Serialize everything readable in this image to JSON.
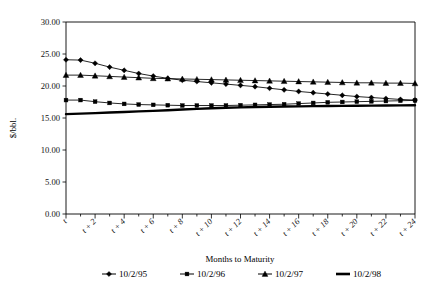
{
  "chart_data": {
    "type": "line",
    "title": "",
    "xlabel": "Months to Maturity",
    "ylabel": "$/bbl.",
    "ylim": [
      0.0,
      30.0
    ],
    "ytick_labels": [
      "0.00",
      "5.00",
      "10.00",
      "15.00",
      "20.00",
      "25.00",
      "30.00"
    ],
    "ytick_values": [
      0.0,
      5.0,
      10.0,
      15.0,
      20.0,
      25.0,
      30.0
    ],
    "grid": false,
    "legend_position": "bottom",
    "x": [
      "t",
      "t + 1",
      "t + 2",
      "t + 3",
      "t + 4",
      "t + 5",
      "t + 6",
      "t + 7",
      "t + 8",
      "t + 9",
      "t + 10",
      "t + 11",
      "t + 12",
      "t + 13",
      "t + 14",
      "t + 15",
      "t + 16",
      "t + 17",
      "t + 18",
      "t + 19",
      "t + 20",
      "t + 21",
      "t + 22",
      "t + 23",
      "t + 24"
    ],
    "xtick_labels": [
      "t",
      "t + 2",
      "t + 4",
      "t + 6",
      "t + 8",
      "t + 10",
      "t + 12",
      "t + 14",
      "t + 16",
      "t + 18",
      "t + 20",
      "t + 22",
      "t + 24"
    ],
    "xtick_indices": [
      0,
      2,
      4,
      6,
      8,
      10,
      12,
      14,
      16,
      18,
      20,
      22,
      24
    ],
    "series": [
      {
        "name": "10/2/95",
        "marker": "diamond",
        "line_weight": "thin",
        "values": [
          24.1,
          24.05,
          23.55,
          22.95,
          22.45,
          21.95,
          21.55,
          21.2,
          20.9,
          20.7,
          20.5,
          20.3,
          20.1,
          19.9,
          19.65,
          19.4,
          19.15,
          18.95,
          18.75,
          18.55,
          18.35,
          18.2,
          18.05,
          17.9,
          17.8
        ]
      },
      {
        "name": "10/2/96",
        "marker": "square",
        "line_weight": "thin",
        "values": [
          17.8,
          17.8,
          17.55,
          17.35,
          17.2,
          17.1,
          17.05,
          17.0,
          16.95,
          16.95,
          16.95,
          16.95,
          17.0,
          17.05,
          17.1,
          17.15,
          17.25,
          17.35,
          17.45,
          17.5,
          17.55,
          17.6,
          17.65,
          17.7,
          17.75
        ]
      },
      {
        "name": "10/2/97",
        "marker": "triangle",
        "line_weight": "thin",
        "values": [
          21.7,
          21.7,
          21.6,
          21.5,
          21.4,
          21.3,
          21.2,
          21.15,
          21.1,
          21.05,
          21.0,
          20.95,
          20.9,
          20.85,
          20.8,
          20.75,
          20.7,
          20.65,
          20.6,
          20.55,
          20.5,
          20.5,
          20.45,
          20.45,
          20.4
        ]
      },
      {
        "name": "10/2/98",
        "marker": "none",
        "line_weight": "thick",
        "values": [
          15.6,
          15.68,
          15.76,
          15.85,
          15.94,
          16.03,
          16.12,
          16.22,
          16.32,
          16.42,
          16.52,
          16.6,
          16.66,
          16.71,
          16.75,
          16.79,
          16.82,
          16.85,
          16.88,
          16.9,
          16.92,
          16.94,
          16.96,
          16.98,
          17.0
        ]
      }
    ]
  },
  "legend": {
    "entries": [
      {
        "label": "10/2/95"
      },
      {
        "label": "10/2/96"
      },
      {
        "label": "10/2/97"
      },
      {
        "label": "10/2/98"
      }
    ]
  },
  "colors": {
    "ink": "#000000",
    "background": "#ffffff"
  }
}
